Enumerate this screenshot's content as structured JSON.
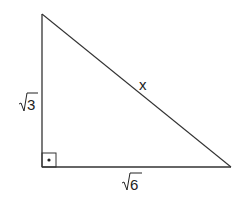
{
  "diagram": {
    "type": "right-triangle",
    "labels": {
      "vertical_leg": "3",
      "horizontal_leg": "6",
      "hypotenuse": "x"
    },
    "radical_sign": "√",
    "right_angle_marker": "square-with-dot",
    "colors": {
      "stroke": "#333333",
      "text": "#222222",
      "background": "#ffffff"
    }
  }
}
